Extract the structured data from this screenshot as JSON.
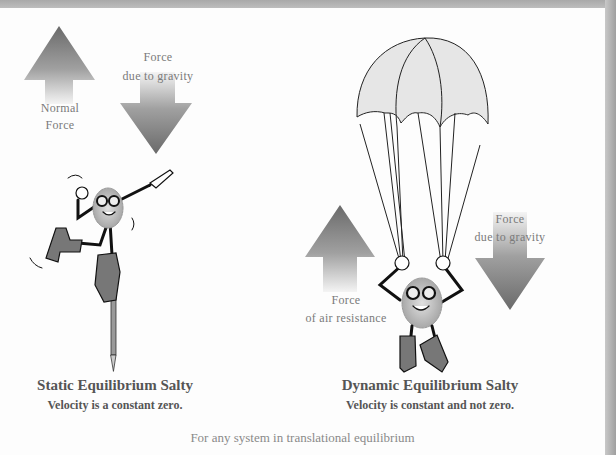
{
  "figure": {
    "left_panel": {
      "normal_force_label": [
        "Normal",
        "Force"
      ],
      "gravity_label": [
        "Force",
        "due to gravity"
      ],
      "title": "Static Equilibrium Salty",
      "subtitle": "Velocity is a constant zero."
    },
    "right_panel": {
      "air_resistance_label": [
        "Force",
        "of air resistance"
      ],
      "gravity_label": [
        "Force",
        "due to gravity"
      ],
      "title": "Dynamic Equilibrium Salty",
      "subtitle": "Velocity is constant and not zero."
    },
    "caption": "For any system in translational equilibrium"
  },
  "colors": {
    "arrow_dark": "#6f6f6f",
    "arrow_light": "#f2f2f2",
    "canopy": "#e6e6e6",
    "frame": "#b0b0b0"
  }
}
